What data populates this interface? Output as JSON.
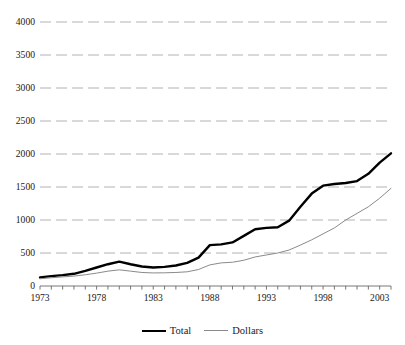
{
  "chart_data": {
    "type": "line",
    "title": "",
    "subtitle": "",
    "xlabel": "",
    "ylabel": "",
    "xlim": [
      1973,
      2004
    ],
    "ylim": [
      0,
      4000
    ],
    "grid": "horizontal-dashed",
    "legend_position": "bottom-center",
    "x": [
      1973,
      1974,
      1975,
      1976,
      1977,
      1978,
      1979,
      1980,
      1981,
      1982,
      1983,
      1984,
      1985,
      1986,
      1987,
      1988,
      1989,
      1990,
      1991,
      1992,
      1993,
      1994,
      1995,
      1996,
      1997,
      1998,
      1999,
      2000,
      2001,
      2002,
      2003,
      2004
    ],
    "ytick_labels": [
      "0",
      "500",
      "1000",
      "1500",
      "2000",
      "2500",
      "3000",
      "3500",
      "4000"
    ],
    "ytick_values": [
      0,
      500,
      1000,
      1500,
      2000,
      2500,
      3000,
      3500,
      4000
    ],
    "xtick_labels": [
      "1973",
      "1978",
      "1983",
      "1988",
      "1993",
      "1998",
      "2003"
    ],
    "xtick_values": [
      1973,
      1978,
      1983,
      1988,
      1993,
      1998,
      2003
    ],
    "series": [
      {
        "name": "Total",
        "color": "#000000",
        "width": 2.4,
        "values": [
          130,
          150,
          165,
          185,
          230,
          280,
          330,
          370,
          330,
          295,
          280,
          290,
          310,
          350,
          430,
          620,
          630,
          660,
          760,
          860,
          880,
          890,
          990,
          1200,
          1400,
          1520,
          1545,
          1560,
          1590,
          1700,
          1870,
          2010
        ]
      },
      {
        "name": "Dollars",
        "color": "#8a8a8a",
        "width": 1,
        "values": [
          110,
          125,
          138,
          150,
          170,
          195,
          225,
          245,
          225,
          205,
          198,
          200,
          205,
          215,
          250,
          320,
          350,
          360,
          390,
          440,
          470,
          500,
          545,
          620,
          700,
          790,
          880,
          1000,
          1100,
          1200,
          1330,
          1480
        ]
      }
    ],
    "series_full": {
      "Total": {
        "years": [
          1973,
          1974,
          1975,
          1976,
          1977,
          1978,
          1979,
          1980,
          1981,
          1982,
          1983,
          1984,
          1985,
          1986,
          1987,
          1988,
          1989,
          1990,
          1991,
          1992,
          1993,
          1994,
          1995,
          1996,
          1997,
          1998,
          1999,
          2000,
          2001,
          2002,
          2003,
          2004
        ],
        "values": [
          130,
          150,
          165,
          185,
          230,
          280,
          330,
          370,
          330,
          295,
          280,
          290,
          310,
          350,
          430,
          620,
          630,
          660,
          760,
          860,
          880,
          890,
          990,
          1200,
          1400,
          1520,
          1545,
          1560,
          1590,
          1700,
          1870,
          2010
        ]
      },
      "Dollars": {
        "years": [
          1973,
          1974,
          1975,
          1976,
          1977,
          1978,
          1979,
          1980,
          1981,
          1982,
          1983,
          1984,
          1985,
          1986,
          1987,
          1988,
          1989,
          1990,
          1991,
          1992,
          1993,
          1994,
          1995,
          1996,
          1997,
          1998,
          1999,
          2000,
          2001,
          2002,
          2003,
          2004
        ],
        "values": [
          110,
          125,
          138,
          150,
          170,
          195,
          225,
          245,
          225,
          205,
          198,
          200,
          205,
          215,
          250,
          320,
          350,
          360,
          390,
          440,
          470,
          500,
          545,
          620,
          700,
          790,
          880,
          1000,
          1100,
          1200,
          1330,
          1480
        ]
      }
    }
  },
  "legend": {
    "entries": [
      {
        "label": "Total"
      },
      {
        "label": "Dollars"
      }
    ]
  },
  "colors": {
    "total_line": "#000000",
    "dollars_line": "#8a8a8a",
    "gridline": "#a9a9a9",
    "axis": "#555555",
    "text": "#1a1a1a",
    "background": "#ffffff"
  }
}
